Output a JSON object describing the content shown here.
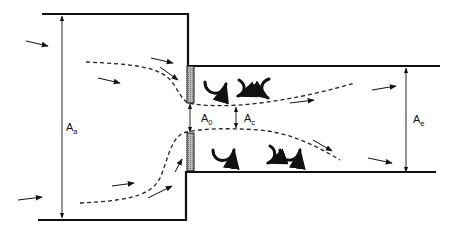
{
  "diagram": {
    "type": "orifice-flow-sudden-contraction",
    "colors": {
      "wall": "#111111",
      "orifice_fill": "#9a9a9a",
      "streamline": "#222222",
      "arrow": "#111111",
      "background": "#ffffff"
    },
    "labels": {
      "upstream_area": {
        "main": "A",
        "sub": "a"
      },
      "orifice_area": {
        "main": "A",
        "sub": "0"
      },
      "vena_contracta_area": {
        "main": "A",
        "sub": "c"
      },
      "downstream_area": {
        "main": "A",
        "sub": "e"
      }
    },
    "regions": {
      "upstream_chamber": {
        "x": 40,
        "y_top": 14,
        "x_right": 188,
        "y_bottom": 219
      },
      "downstream_pipe": {
        "x_left": 188,
        "y_top": 68,
        "x_right": 440,
        "y_bottom": 175
      },
      "orifice_plate_top": {
        "x": 186,
        "y": 66,
        "w": 8,
        "h": 36
      },
      "orifice_plate_bottom": {
        "x": 186,
        "y": 131,
        "w": 8,
        "h": 37
      }
    },
    "dimension_lines": [
      {
        "id": "Aa",
        "x": 62,
        "y1": 16,
        "y2": 218
      },
      {
        "id": "A0",
        "x": 190,
        "y1": 102,
        "y2": 131
      },
      {
        "id": "Ac",
        "x": 235,
        "y1": 106,
        "y2": 128
      },
      {
        "id": "Ae",
        "x": 406,
        "y1": 70,
        "y2": 174
      }
    ],
    "eddies": {
      "top": [
        "ccw-cup",
        "cw-hook",
        "ccw-hook"
      ],
      "bottom": [
        "ccw-cup",
        "cw-hook",
        "ccw-cup"
      ]
    }
  }
}
